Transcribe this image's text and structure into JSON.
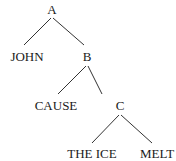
{
  "diagram": {
    "type": "syntax-tree",
    "nodes": [
      {
        "id": "A",
        "label": "A"
      },
      {
        "id": "JOHN",
        "label": "JOHN"
      },
      {
        "id": "B",
        "label": "B"
      },
      {
        "id": "CAUSE",
        "label": "CAUSE"
      },
      {
        "id": "C",
        "label": "C"
      },
      {
        "id": "THE_ICE",
        "label": "THE ICE"
      },
      {
        "id": "MELT",
        "label": "MELT"
      }
    ],
    "edges": [
      {
        "from": "A",
        "to": "JOHN"
      },
      {
        "from": "A",
        "to": "B"
      },
      {
        "from": "B",
        "to": "CAUSE"
      },
      {
        "from": "B",
        "to": "C"
      },
      {
        "from": "C",
        "to": "THE_ICE"
      },
      {
        "from": "C",
        "to": "MELT"
      }
    ]
  }
}
